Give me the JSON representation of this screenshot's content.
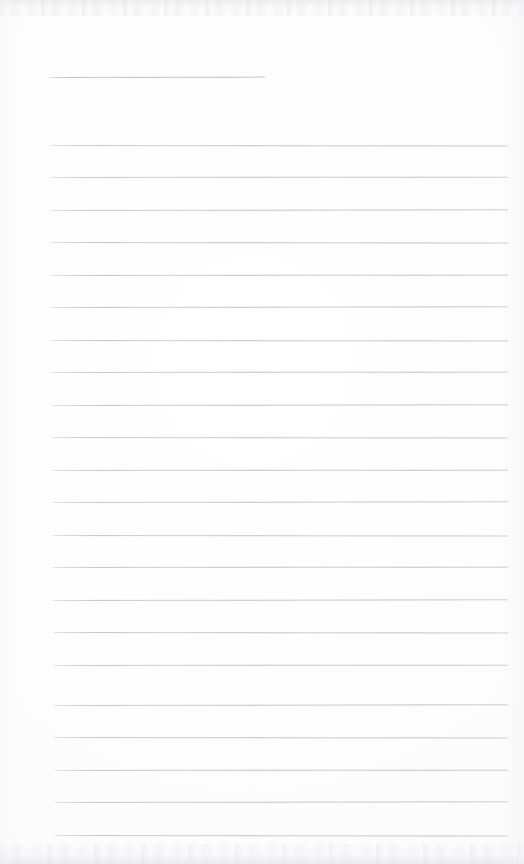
{
  "document": {
    "kind": "scanned-blank-lined-paper",
    "title": "",
    "visible_text": "",
    "page_width": 524,
    "page_height": 864,
    "background_color": "#fdfdfd",
    "rule_color": "#bdbdc2",
    "notes": "Blank ruled writing paper; no handwriting, headings, numbers or other text is rendered anywhere on the page."
  },
  "ruling": {
    "line_count": 23,
    "left_margin_x": 50,
    "right_margin_x": 508,
    "line_spacing": 32.5,
    "line_thickness": 1,
    "lines": [
      {
        "name": "header-rule",
        "x": 49,
        "y": 77,
        "width": 216,
        "short": true
      },
      {
        "name": "body-rule-1",
        "x": 50,
        "y": 145,
        "width": 458,
        "short": false
      },
      {
        "name": "body-rule-2",
        "x": 50,
        "y": 177,
        "width": 458,
        "short": false
      },
      {
        "name": "body-rule-3",
        "x": 50,
        "y": 210,
        "width": 458,
        "short": false
      },
      {
        "name": "body-rule-4",
        "x": 51,
        "y": 242,
        "width": 457,
        "short": false
      },
      {
        "name": "body-rule-5",
        "x": 51,
        "y": 275,
        "width": 457,
        "short": false
      },
      {
        "name": "body-rule-6",
        "x": 51,
        "y": 307,
        "width": 457,
        "short": false
      },
      {
        "name": "body-rule-7",
        "x": 51,
        "y": 340,
        "width": 457,
        "short": false
      },
      {
        "name": "body-rule-8",
        "x": 52,
        "y": 372,
        "width": 456,
        "short": false
      },
      {
        "name": "body-rule-9",
        "x": 52,
        "y": 405,
        "width": 456,
        "short": false
      },
      {
        "name": "body-rule-10",
        "x": 52,
        "y": 437,
        "width": 456,
        "short": false
      },
      {
        "name": "body-rule-11",
        "x": 52,
        "y": 470,
        "width": 456,
        "short": false
      },
      {
        "name": "body-rule-12",
        "x": 53,
        "y": 502,
        "width": 455,
        "short": false
      },
      {
        "name": "body-rule-13",
        "x": 53,
        "y": 535,
        "width": 455,
        "short": false
      },
      {
        "name": "body-rule-14",
        "x": 53,
        "y": 567,
        "width": 455,
        "short": false
      },
      {
        "name": "body-rule-15",
        "x": 53,
        "y": 600,
        "width": 455,
        "short": false
      },
      {
        "name": "body-rule-16",
        "x": 54,
        "y": 632,
        "width": 454,
        "short": false
      },
      {
        "name": "body-rule-17",
        "x": 54,
        "y": 665,
        "width": 454,
        "short": false
      },
      {
        "name": "body-rule-18",
        "x": 54,
        "y": 705,
        "width": 454,
        "short": false
      },
      {
        "name": "body-rule-19",
        "x": 54,
        "y": 737,
        "width": 454,
        "short": false
      },
      {
        "name": "body-rule-20",
        "x": 55,
        "y": 770,
        "width": 453,
        "short": false
      },
      {
        "name": "body-rule-21",
        "x": 55,
        "y": 802,
        "width": 453,
        "short": false
      },
      {
        "name": "body-rule-22",
        "x": 55,
        "y": 835,
        "width": 453,
        "short": false
      }
    ]
  }
}
